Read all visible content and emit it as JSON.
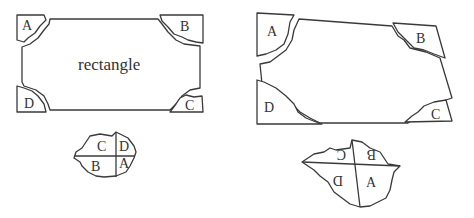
{
  "left_figure": {
    "center_label": "rectangle",
    "corner_labels": {
      "top_left": "A",
      "top_right": "B",
      "bottom_right": "C",
      "bottom_left": "D"
    },
    "assembled": {
      "top_left": "C",
      "top_right": "D",
      "bottom_left": "B",
      "bottom_right": "A"
    }
  },
  "right_figure": {
    "corner_labels": {
      "top_left": "A",
      "top_right": "B",
      "bottom_right": "C",
      "bottom_left": "D"
    },
    "assembled": {
      "top_left": "C",
      "top_right": "B",
      "bottom_left": "D",
      "bottom_right": "A"
    }
  },
  "colors": {
    "stroke": "#3a3a3a",
    "background": "#ffffff"
  }
}
